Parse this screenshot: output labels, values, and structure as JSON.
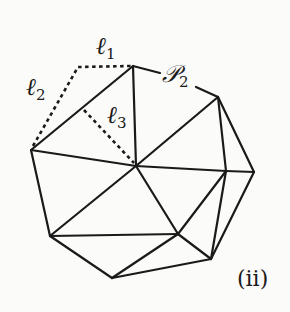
{
  "figure": {
    "tag": "(ii)",
    "labels": {
      "l1": {
        "base": "ℓ",
        "sub": "1"
      },
      "l2": {
        "base": "ℓ",
        "sub": "2"
      },
      "l3": {
        "base": "ℓ",
        "sub": "3"
      },
      "p2": {
        "base": "𝒫",
        "sub": "2"
      }
    },
    "stroke_color": "#1a1a1a",
    "background": "#fbfbf9",
    "vertices": {
      "A": [
        133,
        66
      ],
      "B": [
        218,
        97
      ],
      "C": [
        31,
        150
      ],
      "D": [
        136,
        166
      ],
      "E": [
        226,
        171
      ],
      "F": [
        254,
        172
      ],
      "G": [
        50,
        236
      ],
      "H": [
        178,
        234
      ],
      "I": [
        211,
        259
      ],
      "J": [
        112,
        278
      ]
    },
    "solid_edges": [
      [
        "A",
        "C"
      ],
      [
        "A",
        "D"
      ],
      [
        "B",
        "D"
      ],
      [
        "B",
        "E"
      ],
      [
        "B",
        "F"
      ],
      [
        "C",
        "D"
      ],
      [
        "C",
        "G"
      ],
      [
        "D",
        "G"
      ],
      [
        "D",
        "E"
      ],
      [
        "D",
        "H"
      ],
      [
        "E",
        "F"
      ],
      [
        "E",
        "H"
      ],
      [
        "E",
        "I"
      ],
      [
        "F",
        "I"
      ],
      [
        "G",
        "H"
      ],
      [
        "G",
        "J"
      ],
      [
        "J",
        "H"
      ],
      [
        "J",
        "I"
      ],
      [
        "H",
        "I"
      ]
    ],
    "dotted_paths": [
      {
        "name": "l1-l2-path",
        "points": [
          [
            31,
            150
          ],
          [
            78,
            67
          ],
          [
            133,
            66
          ]
        ]
      },
      {
        "name": "l3-path",
        "points": [
          [
            84,
            110
          ],
          [
            136,
            166
          ]
        ]
      }
    ]
  }
}
